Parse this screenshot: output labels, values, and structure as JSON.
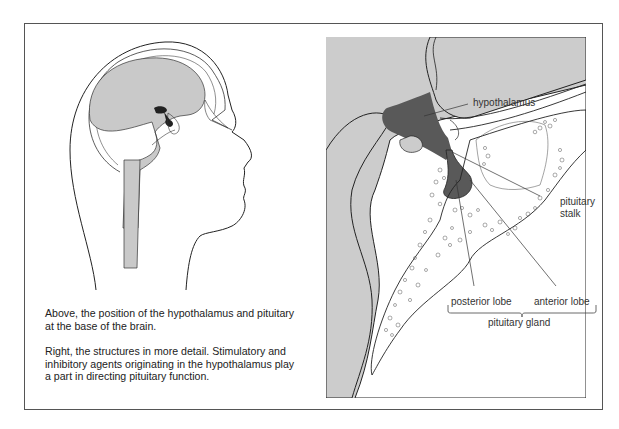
{
  "figure": {
    "left_panel": {
      "illustration": "sagittal-head-brain-outline",
      "highlight_color": "#2a2a2a",
      "brain_color": "#c9c9c9",
      "captions": [
        "Above, the position of the hypothalamus and pituitary at the base of the brain.",
        "Right, the structures in more detail. Stimulatory and inhibitory agents originating in the hypothalamus play a part in directing pituitary function."
      ]
    },
    "right_panel": {
      "illustration": "hypothalamus-pituitary-detail",
      "background_color": "#cccccc",
      "hypothalamus_color": "#595959",
      "labels": {
        "hypothalamus": "hypothalamus",
        "pituitary_stalk_line1": "pituitary",
        "pituitary_stalk_line2": "stalk",
        "posterior_lobe": "posterior lobe",
        "anterior_lobe": "anterior lobe",
        "pituitary_gland": "pituitary gland"
      }
    },
    "frame_color": "#555555"
  }
}
